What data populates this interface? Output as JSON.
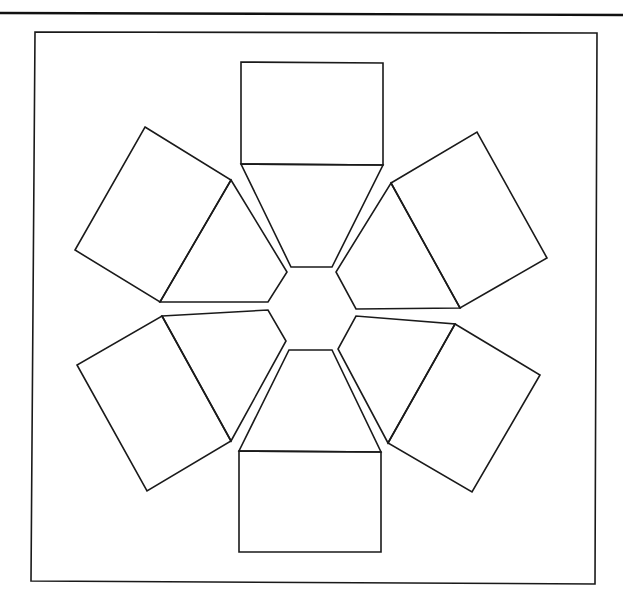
{
  "diagram": {
    "stroke_color": "#1a1a1a",
    "background": "#ffffff",
    "top_rule": {
      "x1": 0,
      "y1": 13,
      "x2": 623,
      "y2": 15
    },
    "frame": {
      "points": "35,32 597,33 595,584 31,581"
    },
    "rectangles": [
      {
        "id": "top",
        "points": "241,62 383,63 383,165 241,164"
      },
      {
        "id": "upper-right",
        "points": "391,183 477,132 547,258 460,308"
      },
      {
        "id": "lower-right",
        "points": "455,324 540,375 472,492 388,443"
      },
      {
        "id": "bottom",
        "points": "239,451 381,452 381,552 239,552"
      },
      {
        "id": "lower-left",
        "points": "162,316 231,441 147,491 77,365"
      },
      {
        "id": "upper-left",
        "points": "145,127 231,180 160,302 75,250"
      }
    ],
    "trapezoids": [
      {
        "id": "top",
        "points": "241,164 383,165 332,267 291,267"
      },
      {
        "id": "upper-right",
        "points": "391,183 460,308 356,309 336,272"
      },
      {
        "id": "lower-right",
        "points": "455,324 388,443 338,349 356,316"
      },
      {
        "id": "bottom",
        "points": "239,451 381,452 332,350 289,350"
      },
      {
        "id": "lower-left",
        "points": "162,316 268,310 286,341 231,441"
      },
      {
        "id": "upper-left",
        "points": "231,180 287,272 268,302 160,302"
      }
    ]
  }
}
